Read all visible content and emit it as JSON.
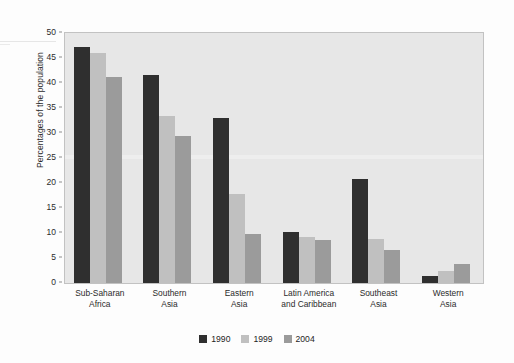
{
  "chart_data": {
    "type": "bar",
    "title": "",
    "subtitle": "",
    "xlabel": "",
    "ylabel": "Percentages of the population",
    "ylim": [
      0,
      50
    ],
    "ytick_step": 5,
    "yticks": [
      "0",
      "5",
      "10",
      "15",
      "20",
      "25",
      "30",
      "35",
      "40",
      "45",
      "50"
    ],
    "grid": false,
    "legend_position": "bottom-center",
    "categories": [
      "Sub-Saharan Africa",
      "Southern Asia",
      "Eastern Asia",
      "Latin America and Caribbean",
      "Southeast Asia",
      "Western Asia"
    ],
    "category_lines": [
      [
        "Sub-Saharan",
        "Africa"
      ],
      [
        "Southern",
        "Asia"
      ],
      [
        "Eastern",
        "Asia"
      ],
      [
        "Latin America",
        "and Caribbean"
      ],
      [
        "Southeast",
        "Asia"
      ],
      [
        "Western",
        "Asia"
      ]
    ],
    "series": [
      {
        "name": "1990",
        "color": "#2f2f2f",
        "values": [
          47.2,
          41.6,
          33.0,
          10.3,
          20.8,
          1.5
        ]
      },
      {
        "name": "1999",
        "color": "#c0c0c0",
        "values": [
          46.0,
          33.5,
          17.8,
          9.3,
          8.8,
          2.5
        ]
      },
      {
        "name": "2004",
        "color": "#9b9b9b",
        "values": [
          41.3,
          29.5,
          9.9,
          8.6,
          6.7,
          3.9
        ]
      }
    ]
  },
  "legend": {
    "items": [
      {
        "label": "1990",
        "color": "#2f2f2f"
      },
      {
        "label": "1999",
        "color": "#c0c0c0"
      },
      {
        "label": "2004",
        "color": "#9b9b9b"
      }
    ]
  },
  "colors": {
    "plot_background": "#e7e7e7",
    "plot_border": "#c2c2c2",
    "page_background": "#fdfdfd",
    "text": "#2b2b2b"
  }
}
